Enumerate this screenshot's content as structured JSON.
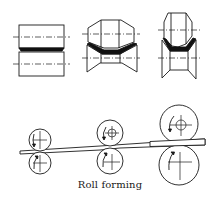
{
  "figure": {
    "caption": "Roll forming",
    "line_color": "#1a1a1a",
    "fill_dark": "#111111",
    "background": "#ffffff"
  },
  "cross_sections": [
    {
      "stage": 1,
      "profile": "flat"
    },
    {
      "stage": 2,
      "profile": "shallow-v"
    },
    {
      "stage": 3,
      "profile": "deep-v"
    }
  ],
  "roll_stands": [
    {
      "stage": 1,
      "top_roll": "small",
      "bottom_roll": "small"
    },
    {
      "stage": 2,
      "top_roll": "medium",
      "bottom_roll": "medium"
    },
    {
      "stage": 3,
      "top_roll": "large",
      "bottom_roll": "large"
    }
  ]
}
